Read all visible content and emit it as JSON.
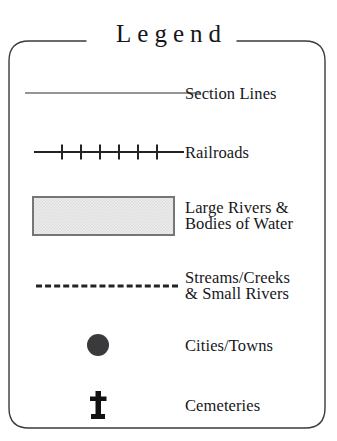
{
  "legend": {
    "title": "Legend",
    "frame": {
      "shape": "rounded-rectangle",
      "border_color": "#3a3a3f",
      "fill_color": "#ffffff"
    },
    "entries": [
      {
        "id": "section-lines",
        "symbol": "solid-thin-line",
        "symbol_color": "#2c2c31",
        "label_lines": [
          "Section Lines"
        ]
      },
      {
        "id": "railroads",
        "symbol": "line-with-crossties",
        "symbol_color": "#232327",
        "crosstie_count": 6,
        "label_lines": [
          "Railroads"
        ]
      },
      {
        "id": "large-rivers-bodies-of-water",
        "symbol": "filled-rectangle",
        "symbol_fill": "#ececed",
        "symbol_border": "#767678",
        "label_lines": [
          "Large Rivers &",
          "Bodies of Water"
        ]
      },
      {
        "id": "streams-creeks-small-rivers",
        "symbol": "dashed-line",
        "symbol_color": "#232327",
        "label_lines": [
          "Streams/Creeks",
          "& Small Rivers"
        ]
      },
      {
        "id": "cities-towns",
        "symbol": "filled-circle",
        "symbol_color": "#3a3a3c",
        "label_lines": [
          "Cities/Towns"
        ]
      },
      {
        "id": "cemeteries",
        "symbol": "cross-marker",
        "symbol_color": "#121214",
        "label_lines": [
          "Cemeteries"
        ]
      }
    ]
  }
}
